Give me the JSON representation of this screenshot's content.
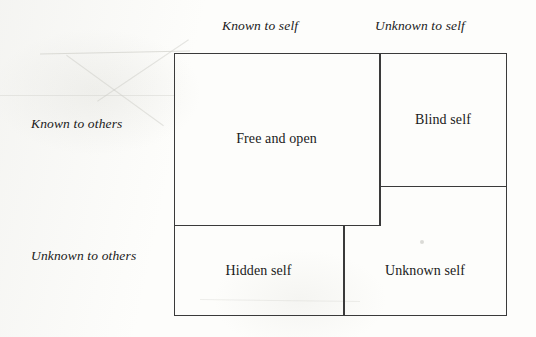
{
  "diagram": {
    "type": "johari-window",
    "axes": {
      "columns": [
        {
          "id": "known-self",
          "label": "Known to self"
        },
        {
          "id": "unknown-self",
          "label": "Unknown to self"
        }
      ],
      "rows": [
        {
          "id": "known-others",
          "label": "Known to others"
        },
        {
          "id": "unknown-others",
          "label": "Unknown to others"
        }
      ]
    },
    "quadrants": [
      {
        "id": "free-and-open",
        "label": "Free and open",
        "row": "known-others",
        "column": "known-self"
      },
      {
        "id": "blind-self",
        "label": "Blind self",
        "row": "known-others",
        "column": "unknown-self"
      },
      {
        "id": "hidden-self",
        "label": "Hidden self",
        "row": "unknown-others",
        "column": "known-self"
      },
      {
        "id": "unknown-self",
        "label": "Unknown self",
        "row": "unknown-others",
        "column": "unknown-self"
      }
    ],
    "colors": {
      "line": "#3a3a3a",
      "text": "#1a1a1a",
      "background": "#fdfdfb"
    }
  }
}
